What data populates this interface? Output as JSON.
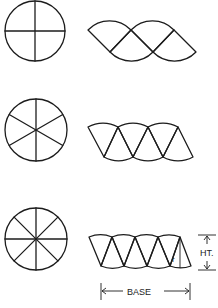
{
  "diagram": {
    "rows": [
      {
        "id": "row-4-sectors",
        "sectors": 4,
        "circle": {
          "cx": 35,
          "cy": 31,
          "r": 30
        },
        "rearranged_shape": "two sectors up, two down forming wavy band"
      },
      {
        "id": "row-6-sectors",
        "sectors": 6,
        "circle": {
          "cx": 36,
          "cy": 130,
          "r": 31
        },
        "rearranged_shape": "alternating sectors forming near-parallelogram"
      },
      {
        "id": "row-8-sectors",
        "sectors": 8,
        "circle": {
          "cx": 36,
          "cy": 239,
          "r": 31
        },
        "rearranged_shape": "alternating sectors approaching parallelogram"
      }
    ],
    "labels": {
      "radius": "r",
      "height": "HT.",
      "base": "BASE"
    },
    "colors": {
      "line": "#1c1c1c",
      "background": "#ffffff"
    }
  }
}
